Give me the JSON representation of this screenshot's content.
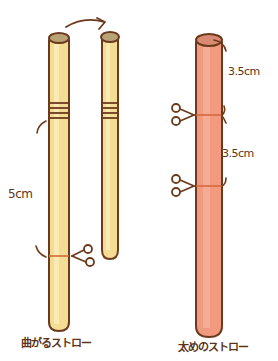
{
  "colors": {
    "outline": "#6b3a1c",
    "bendy_fill": "#f5dc95",
    "bendy_highlight": "#fbeebc",
    "bendy_cap": "#b8a276",
    "thick_fill": "#f29a80",
    "thick_highlight": "#f7b9a5",
    "thick_cap": "#d98a72",
    "cut_line": "#d46a3c",
    "background": "#ffffff"
  },
  "left_group": {
    "measurement_label": "5cm",
    "caption": "曲がるストロー",
    "arrow": "curved-arrow-right",
    "cut_mark": "scissors-icon"
  },
  "right_group": {
    "measurement_top": "3.5cm",
    "measurement_middle": "3.5cm",
    "caption": "太めのストロー",
    "cut_marks": [
      "scissors-icon",
      "scissors-icon"
    ]
  }
}
